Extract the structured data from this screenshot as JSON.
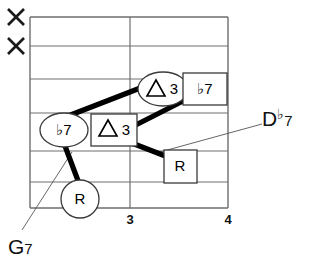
{
  "diagram": {
    "type": "guitar-chord-fretboard",
    "title_visible": false,
    "muted_strings": [
      {
        "symbol": "×",
        "string_index": 1
      },
      {
        "symbol": "×",
        "string_index": 2
      }
    ],
    "fret_numbers": [
      {
        "label": "3",
        "x": 130
      },
      {
        "label": "4",
        "x": 228
      }
    ],
    "grid": {
      "string_count": 6,
      "left": 30,
      "right": 228,
      "top": 17,
      "bottom": 208,
      "vertical_lines": [
        30,
        130,
        228
      ],
      "horizontal_lines": [
        17,
        46,
        79,
        113,
        151,
        182,
        208
      ]
    },
    "markers": [
      {
        "id": "marker-flat7-left",
        "shape": "ellipse",
        "text": "♭7",
        "interval": "b7",
        "cx": 64,
        "cy": 130,
        "rx": 24,
        "ry": 17
      },
      {
        "id": "marker-maj3-box",
        "shape": "square",
        "text": "△3",
        "interval": "M3",
        "cx": 114,
        "cy": 130,
        "w": 46,
        "h": 32
      },
      {
        "id": "marker-maj3-ellipse",
        "shape": "ellipse",
        "text": "△3",
        "interval": "M3",
        "cx": 163,
        "cy": 89,
        "rx": 24,
        "ry": 17
      },
      {
        "id": "marker-flat7-box",
        "shape": "square",
        "text": "♭7",
        "interval": "b7",
        "cx": 205,
        "cy": 89,
        "w": 44,
        "h": 32
      },
      {
        "id": "marker-root-box",
        "shape": "square",
        "text": "R",
        "interval": "R",
        "cx": 180,
        "cy": 166,
        "w": 32,
        "h": 32
      },
      {
        "id": "marker-root-circle",
        "shape": "circle",
        "text": "R",
        "interval": "R",
        "cx": 80,
        "cy": 199,
        "rx": 19,
        "ry": 19
      }
    ],
    "connectors": [
      {
        "id": "connector-flat7-to-maj3",
        "x1": 68,
        "y1": 116,
        "x2": 146,
        "y2": 86
      },
      {
        "id": "connector-maj3-to-flat7box",
        "x1": 118,
        "y1": 134,
        "x2": 181,
        "y2": 102
      },
      {
        "id": "connector-maj3box-to-rootbox",
        "x1": 124,
        "y1": 140,
        "x2": 172,
        "y2": 160
      },
      {
        "id": "connector-flat7-to-rootcircle",
        "x1": 64,
        "y1": 147,
        "x2": 80,
        "y2": 186
      }
    ],
    "leaders": [
      {
        "id": "leader-g7",
        "x1": 22,
        "y1": 230,
        "x2": 72,
        "y2": 152
      },
      {
        "id": "leader-dflat7",
        "x1": 160,
        "y1": 152,
        "x2": 262,
        "y2": 124
      }
    ],
    "labels": {
      "chord_left": {
        "root": "G",
        "quality": "7",
        "text": "G7",
        "x": 10,
        "y": 238
      },
      "chord_right": {
        "root": "D",
        "accidental": "♭",
        "quality": "7",
        "text": "D♭7",
        "x": 263,
        "y": 110
      }
    }
  }
}
